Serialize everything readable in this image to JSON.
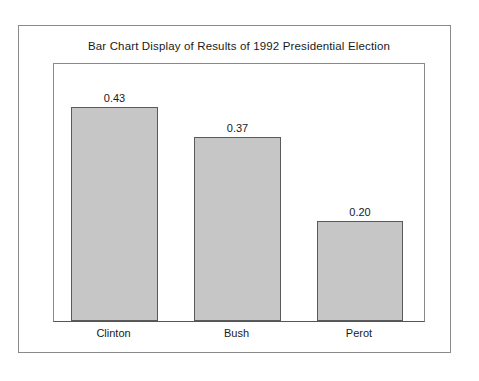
{
  "chart_data": {
    "type": "bar",
    "title": "Bar Chart Display of Results of 1992 Presidential Election",
    "xlabel": "",
    "ylabel": "",
    "categories": [
      "Clinton",
      "Bush",
      "Perot"
    ],
    "values": [
      0.43,
      0.37,
      0.2
    ],
    "value_labels": [
      "0.43",
      "0.37",
      "0.20"
    ],
    "ylim": [
      0,
      0.52
    ],
    "grid": false,
    "legend": false,
    "bar_fill_color": "#c6c6c6",
    "bar_border_color": "#5a5a5a",
    "frame_color": "#8a8a8a",
    "background_color": "#ffffff",
    "text_color": "#1a1a1a"
  }
}
